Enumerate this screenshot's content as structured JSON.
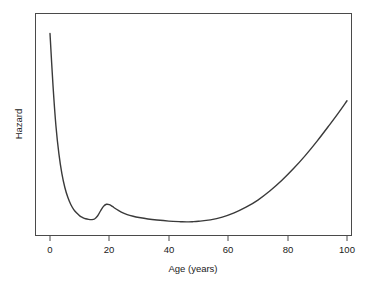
{
  "chart_data": {
    "type": "line",
    "title": "",
    "xlabel": "Age (years)",
    "ylabel": "Hazard",
    "xlim": [
      0,
      100
    ],
    "ylim": [
      0,
      1
    ],
    "grid": false,
    "legend": null,
    "x_ticks": [
      0,
      20,
      40,
      60,
      80,
      100
    ],
    "x_tick_labels": [
      "0",
      "20",
      "40",
      "60",
      "80",
      "100"
    ],
    "y_ticks": [],
    "y_tick_labels": [],
    "series": [
      {
        "name": "Hazard",
        "color": "#3a3a3a",
        "x": [
          0,
          1,
          2,
          3,
          4,
          5,
          6,
          7,
          8,
          9,
          10,
          11,
          12,
          13,
          14,
          15,
          16,
          17,
          18,
          19,
          20,
          21,
          22,
          24,
          26,
          28,
          30,
          33,
          36,
          40,
          44,
          46,
          48,
          50,
          54,
          58,
          62,
          66,
          70,
          74,
          78,
          82,
          86,
          90,
          94,
          97,
          100
        ],
        "y": [
          0.945,
          0.7,
          0.505,
          0.372,
          0.278,
          0.212,
          0.165,
          0.131,
          0.107,
          0.09,
          0.077,
          0.069,
          0.063,
          0.06,
          0.059,
          0.062,
          0.076,
          0.1,
          0.122,
          0.132,
          0.13,
          0.122,
          0.112,
          0.095,
          0.083,
          0.075,
          0.069,
          0.062,
          0.057,
          0.052,
          0.049,
          0.048,
          0.049,
          0.051,
          0.058,
          0.071,
          0.091,
          0.118,
          0.152,
          0.195,
          0.245,
          0.302,
          0.365,
          0.434,
          0.508,
          0.565,
          0.625
        ]
      }
    ],
    "annotations": {
      "infant_mortality_start_value": 0.945,
      "childhood_minimum_age": 14,
      "accident_hump_peak_age": 19,
      "midlife_minimum_age": 46,
      "final_age": 100
    }
  },
  "labels": {
    "x_axis": "Age (years)",
    "y_axis": "Hazard"
  }
}
